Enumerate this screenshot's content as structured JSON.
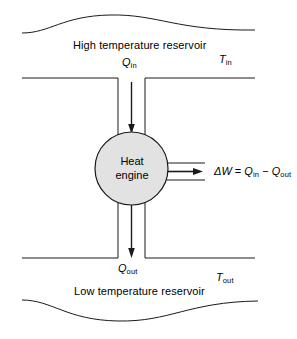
{
  "diagram": {
    "colors": {
      "stroke": "#1a1a1a",
      "engine_fill": "#e2e2e2",
      "background": "#ffffff"
    },
    "hot_reservoir": {
      "label": "High temperature reservoir",
      "temperature_symbol": "T",
      "temperature_subscript": "in"
    },
    "cold_reservoir": {
      "label": "Low temperature reservoir",
      "temperature_symbol": "T",
      "temperature_subscript": "out"
    },
    "engine": {
      "label_line1": "Heat",
      "label_line2": "engine"
    },
    "heat_in": {
      "symbol": "Q",
      "subscript": "in"
    },
    "heat_out": {
      "symbol": "Q",
      "subscript": "out"
    },
    "work": {
      "symbol": "ΔW",
      "equals": "=",
      "term1_symbol": "Q",
      "term1_subscript": "in",
      "minus": "−",
      "term2_symbol": "Q",
      "term2_subscript": "out"
    }
  }
}
